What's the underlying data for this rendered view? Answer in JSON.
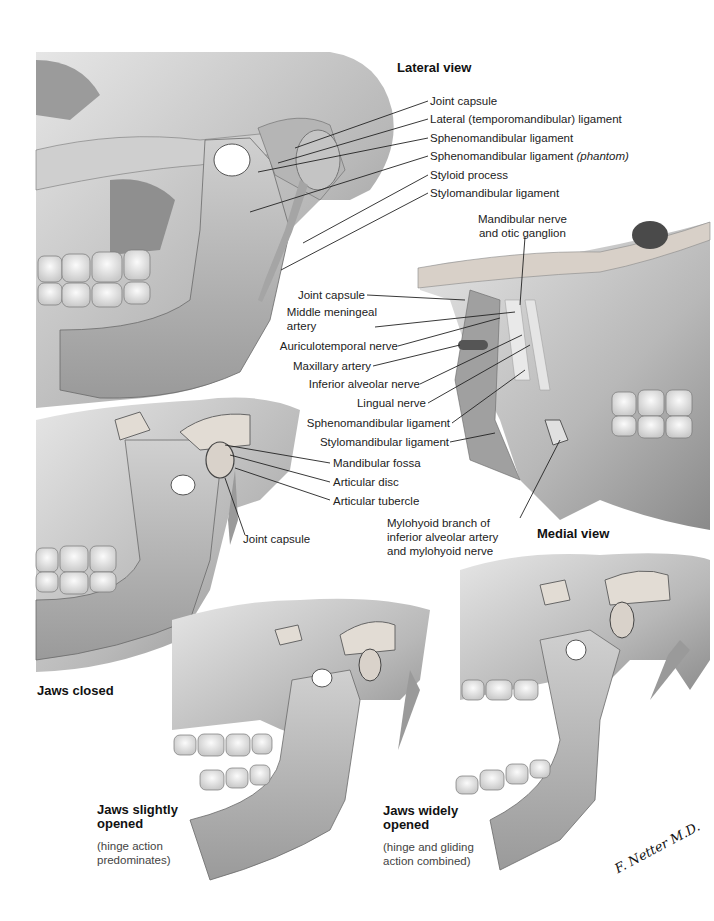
{
  "figure": {
    "colors": {
      "background": "#ffffff",
      "bone_light": "#dcdcdc",
      "bone_mid": "#a8a8a8",
      "bone_dark": "#5a5a5a",
      "leader": "#222222"
    }
  },
  "lateral_view": {
    "title": "Lateral view",
    "labels": [
      "Joint capsule",
      "Lateral (temporomandibular) ligament",
      "Sphenomandibular ligament",
      "Sphenomandibular ligament",
      "(phantom)",
      "Styloid process",
      "Stylomandibular ligament"
    ]
  },
  "medial_view": {
    "title": "Medial view",
    "labels": {
      "mandibular_nerve_1": "Mandibular nerve",
      "mandibular_nerve_2": "and otic ganglion",
      "joint_capsule": "Joint capsule",
      "middle_meningeal_1": "Middle meningeal",
      "middle_meningeal_2": "artery",
      "auriculotemporal": "Auriculotemporal nerve",
      "maxillary_artery": "Maxillary artery",
      "inferior_alveolar": "Inferior alveolar nerve",
      "lingual": "Lingual nerve",
      "sphenomandibular": "Sphenomandibular ligament",
      "stylomandibular": "Stylomandibular ligament",
      "mylohyoid_1": "Mylohyoid branch of",
      "mylohyoid_2": "inferior alveolar artery",
      "mylohyoid_3": "and mylohyoid nerve"
    }
  },
  "jaws_closed": {
    "title": "Jaws closed",
    "labels": {
      "mandibular_fossa": "Mandibular fossa",
      "articular_disc": "Articular disc",
      "articular_tubercle": "Articular tubercle",
      "joint_capsule": "Joint capsule"
    }
  },
  "jaws_slightly_opened": {
    "title_1": "Jaws slightly",
    "title_2": "opened",
    "note_1": "(hinge action",
    "note_2": "predominates)"
  },
  "jaws_widely_opened": {
    "title_1": "Jaws widely",
    "title_2": "opened",
    "note_1": "(hinge and gliding",
    "note_2": "action combined)"
  },
  "signature": "F. Netter M.D."
}
